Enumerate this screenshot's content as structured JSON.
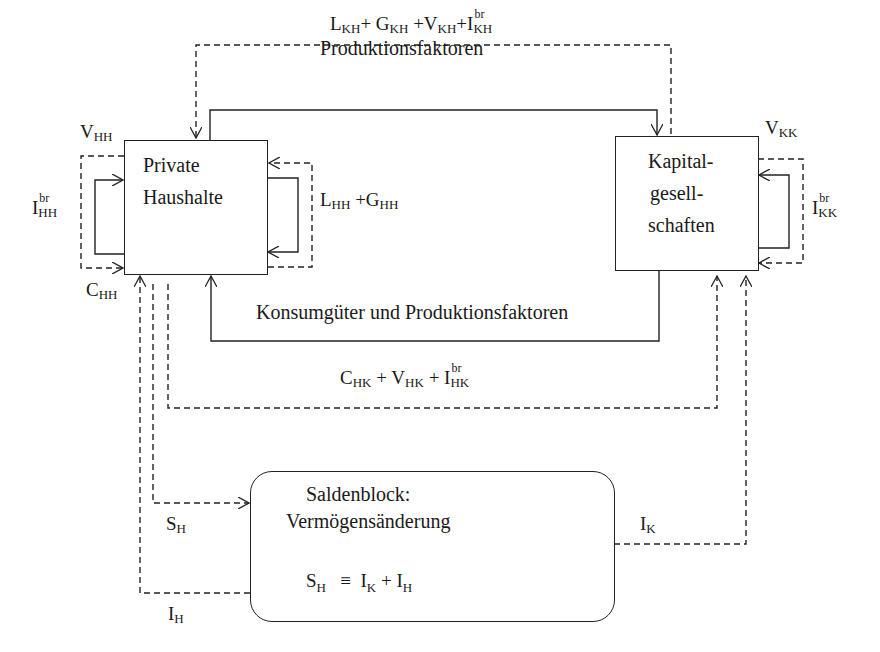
{
  "nodes": {
    "households": {
      "line1": "Private",
      "line2": "Haushalte"
    },
    "corporations": {
      "line1": "Kapital-",
      "line2": "gesell-",
      "line3": "schaften"
    },
    "balance": {
      "title": "Saldenblock:",
      "subtitle": "Vermögensänderung",
      "identity_lhs": "S",
      "identity_lhs_sub": "H",
      "identity_op": "≡",
      "identity_rhs1": "I",
      "identity_rhs1_sub": "K",
      "identity_plus": "+",
      "identity_rhs2": "I",
      "identity_rhs2_sub": "H"
    }
  },
  "top_flow": {
    "L": "L",
    "L_sub": "KH",
    "G": "G",
    "G_sub": "KH",
    "V": "V",
    "V_sub": "KH",
    "I": "I",
    "I_sup": "br",
    "I_sub": "KH",
    "plus": "+",
    "caption": "Produktionsfaktoren"
  },
  "household_labels": {
    "V": "V",
    "V_sub": "HH",
    "I": "I",
    "I_sup": "br",
    "I_sub": "HH",
    "C": "C",
    "C_sub": "HH",
    "LG": "L",
    "LG_L_sub": "HH",
    "LG_plus": "+G",
    "LG_G_sub": "HH"
  },
  "corporation_labels": {
    "V": "V",
    "V_sub": "KK",
    "I": "I",
    "I_sup": "br",
    "I_sub": "KK"
  },
  "middle_flow": {
    "caption": "Konsumgüter und Produktionsfaktoren",
    "C": "C",
    "C_sub": "HK",
    "V": "V",
    "V_sub": "HK",
    "I": "I",
    "I_sup": "br",
    "I_sub": "HK",
    "plus": "+"
  },
  "saving_flows": {
    "SH": "S",
    "SH_sub": "H",
    "IH": "I",
    "IH_sub": "H",
    "IK": "I",
    "IK_sub": "K"
  }
}
